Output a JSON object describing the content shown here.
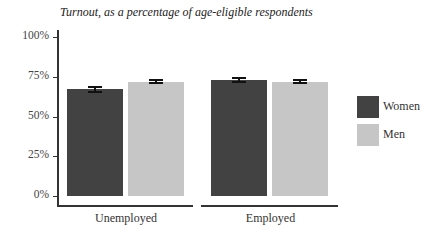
{
  "chart_data": {
    "type": "bar",
    "title": "Turnout, as a percentage of age-eligible respondents",
    "xlabel": "",
    "ylabel": "",
    "ylim": [
      0,
      100
    ],
    "yticks": [
      "0%",
      "25%",
      "50%",
      "75%",
      "100%"
    ],
    "categories": [
      "Unemployed",
      "Employed"
    ],
    "series": [
      {
        "name": "Women",
        "color": "#424242",
        "values": [
          67,
          73
        ],
        "error": [
          1.5,
          1.0
        ]
      },
      {
        "name": "Men",
        "color": "#c6c6c6",
        "values": [
          72,
          72
        ],
        "error": [
          1.2,
          1.0
        ]
      }
    ],
    "legend_position": "right",
    "grid": false
  }
}
